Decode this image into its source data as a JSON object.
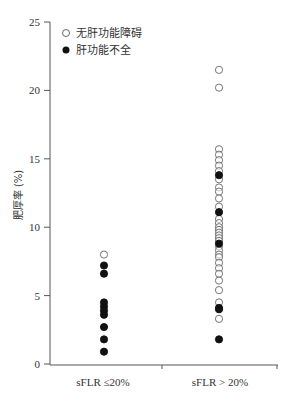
{
  "chart_data": {
    "type": "scatter",
    "title": "",
    "xlabel": "",
    "ylabel": "肥厚率 (%)",
    "ylim": [
      0,
      25
    ],
    "yticks": [
      0,
      5,
      10,
      15,
      20,
      25
    ],
    "categories": [
      "sFLR ≤20%",
      "sFLR > 20%"
    ],
    "grid": false,
    "legend_position": "top-left",
    "series": [
      {
        "name": "无肝功能障碍",
        "marker": "open-circle",
        "points": [
          {
            "category": "sFLR ≤20%",
            "values": [
              8.0
            ]
          },
          {
            "category": "sFLR > 20%",
            "values": [
              21.5,
              20.2,
              15.7,
              15.3,
              14.9,
              14.5,
              14.1,
              13.5,
              12.9,
              12.6,
              12.1,
              11.5,
              10.6,
              10.3,
              10.0,
              9.8,
              9.6,
              9.4,
              9.2,
              9.0,
              8.6,
              8.3,
              8.0,
              7.8,
              7.4,
              7.0,
              6.6,
              6.1,
              5.4,
              4.5,
              3.3
            ]
          }
        ]
      },
      {
        "name": "肝功能不全",
        "marker": "filled-circle",
        "points": [
          {
            "category": "sFLR ≤20%",
            "values": [
              7.2,
              6.6,
              4.5,
              4.2,
              3.9,
              3.6,
              2.7,
              1.8,
              0.9
            ]
          },
          {
            "category": "sFLR > 20%",
            "values": [
              13.8,
              11.1,
              8.8,
              4.1,
              4.0,
              1.8
            ]
          }
        ]
      }
    ]
  },
  "legend": {
    "item_open": "无肝功能障碍",
    "item_filled": "肝功能不全"
  },
  "axis": {
    "ylabel": "肥厚率 (%)",
    "yticks": [
      "0",
      "5",
      "10",
      "15",
      "20",
      "25"
    ],
    "xticks": [
      "sFLR ≤20%",
      "sFLR > 20%"
    ]
  }
}
